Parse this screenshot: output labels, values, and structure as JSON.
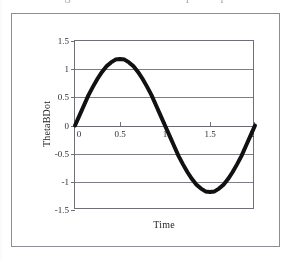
{
  "caption": {
    "text": "Figure — ThetaBDot response plot"
  },
  "chart_data": {
    "type": "line",
    "title": "",
    "xlabel": "Time",
    "ylabel": "ThetaBDot",
    "xlim": [
      0,
      2
    ],
    "ylim": [
      -1.5,
      1.5
    ],
    "xticks": [
      "0",
      "0.5",
      "1",
      "1.5",
      "2"
    ],
    "xtick_values": [
      0,
      0.5,
      1,
      1.5,
      2
    ],
    "yticks": [
      "1.5",
      "1",
      "0.5",
      "0",
      "-0.5",
      "-1",
      "-1.5"
    ],
    "ytick_values": [
      1.5,
      1,
      0.5,
      0,
      -0.5,
      -1,
      -1.5
    ],
    "grid": "horizontal",
    "legend": "none",
    "series": [
      {
        "name": "ThetaBDot",
        "color": "#111111",
        "line_width": 4,
        "x": [
          0,
          0.05,
          0.1,
          0.15,
          0.2,
          0.25,
          0.3,
          0.35,
          0.4,
          0.45,
          0.5,
          0.55,
          0.6,
          0.65,
          0.7,
          0.75,
          0.8,
          0.85,
          0.9,
          0.95,
          1.0,
          1.05,
          1.1,
          1.15,
          1.2,
          1.25,
          1.3,
          1.35,
          1.4,
          1.45,
          1.5,
          1.55,
          1.6,
          1.65,
          1.7,
          1.75,
          1.8,
          1.85,
          1.9,
          1.95,
          2.0
        ],
        "values": [
          0.0,
          0.18,
          0.36,
          0.54,
          0.69,
          0.83,
          0.95,
          1.05,
          1.12,
          1.17,
          1.18,
          1.17,
          1.12,
          1.05,
          0.95,
          0.83,
          0.69,
          0.54,
          0.36,
          0.18,
          0.0,
          -0.18,
          -0.36,
          -0.54,
          -0.69,
          -0.83,
          -0.95,
          -1.05,
          -1.12,
          -1.17,
          -1.18,
          -1.17,
          -1.12,
          -1.05,
          -0.95,
          -0.83,
          -0.69,
          -0.54,
          -0.36,
          -0.18,
          0.0
        ]
      }
    ]
  },
  "colors": {
    "curve": "#111111",
    "gridline": "#7d7d85",
    "frame": "#8d8d95",
    "plot_border": "#6f6f77",
    "text": "#2f2f33",
    "background": "#ffffff"
  }
}
